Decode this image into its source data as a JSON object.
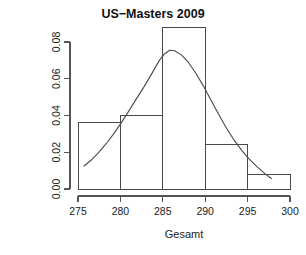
{
  "chart_data": {
    "type": "bar",
    "title": "US−Masters 2009",
    "xlabel": "Gesamt",
    "ylabel": "Density",
    "xlim": [
      275,
      300
    ],
    "ylim": [
      0,
      0.088
    ],
    "grid": false,
    "legend": "none",
    "bin_width": 5,
    "bin_edges": [
      275,
      280,
      285,
      290,
      295,
      300
    ],
    "categories": [
      "275–280",
      "280–285",
      "285–290",
      "290–295",
      "295–300"
    ],
    "values": [
      0.036,
      0.04,
      0.088,
      0.024,
      0.008
    ],
    "xticks": [
      275,
      280,
      285,
      290,
      295,
      300
    ],
    "xtick_labels": [
      "275",
      "280",
      "285",
      "290",
      "295",
      "300"
    ],
    "yticks": [
      0.0,
      0.02,
      0.04,
      0.06,
      0.08
    ],
    "ytick_labels": [
      "0.00",
      "0.02",
      "0.04",
      "0.06",
      "0.08"
    ],
    "overlay": {
      "name": "density",
      "type": "line",
      "peak_x": 285.8,
      "peak_y": 0.0755,
      "x_start": 275.7,
      "x_end": 297.8,
      "x": [
        275.7,
        276.5,
        277.4,
        278.3,
        279.2,
        280.1,
        281.0,
        281.9,
        282.8,
        283.7,
        284.6,
        285.2,
        285.8,
        286.4,
        287.2,
        288.0,
        288.9,
        289.8,
        290.7,
        291.6,
        292.5,
        293.4,
        294.3,
        295.2,
        296.1,
        297.0,
        297.8
      ],
      "y": [
        0.0125,
        0.0155,
        0.0197,
        0.0245,
        0.03,
        0.036,
        0.0425,
        0.0492,
        0.0557,
        0.0628,
        0.07,
        0.0735,
        0.0755,
        0.0752,
        0.073,
        0.069,
        0.063,
        0.056,
        0.0482,
        0.0405,
        0.0332,
        0.0267,
        0.021,
        0.0163,
        0.0122,
        0.0085,
        0.0057
      ]
    }
  },
  "chart_colors": {
    "background": "#ffffff",
    "axis": "#555555",
    "bar_stroke": "#4a4a4a",
    "curve": "#4a4a4a",
    "text": "#222222",
    "title_text": "#111111"
  }
}
